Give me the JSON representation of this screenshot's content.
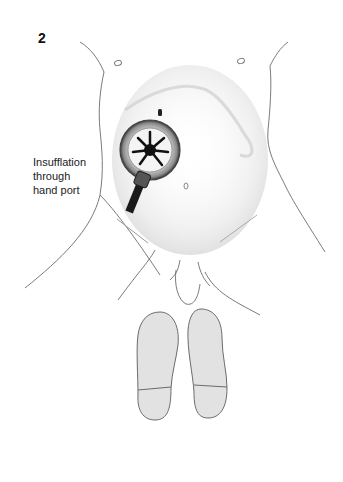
{
  "figure": {
    "number": "2",
    "annotation_lines": [
      "Insufflation",
      "through",
      "hand port"
    ],
    "colors": {
      "outline": "#6b6b6b",
      "shading": "#d6d6d6",
      "sole_fill": "#e2e2e2",
      "port_dark": "#1a1a1a",
      "background": "#ffffff"
    }
  }
}
